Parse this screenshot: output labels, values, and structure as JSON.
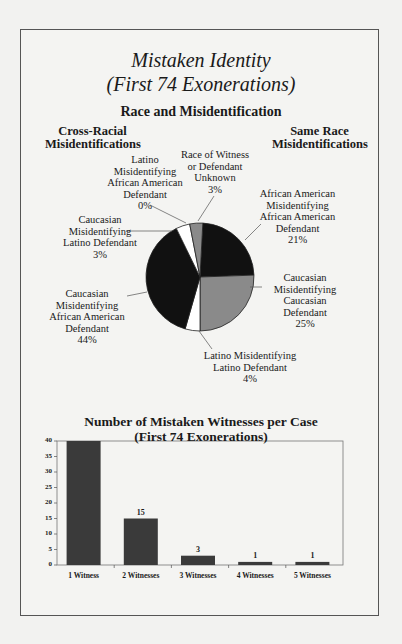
{
  "page": {
    "title": "Mistaken Identity",
    "subtitle": "(First 74 Exonerations)"
  },
  "pie": {
    "title": "Race and Misidentification",
    "group_left": [
      "Cross-Racial",
      "Misidentifications"
    ],
    "group_right": [
      "Same Race",
      "Misidentifications"
    ]
  },
  "bar": {
    "title": "Number of Mistaken Witnesses per Case",
    "subtitle": "(First 74 Exonerations)"
  },
  "chart_data": [
    {
      "type": "pie",
      "title": "Race and Misidentification",
      "annotations": [
        "Cross-Racial Misidentifications",
        "Same Race Misidentifications"
      ],
      "slices": [
        {
          "label": "African American Misidentifying African American Defendant",
          "value": 21,
          "unit": "%",
          "color": "#111111",
          "group": "Same Race"
        },
        {
          "label": "Caucasian Misidentifying Caucasian Defendant",
          "value": 25,
          "unit": "%",
          "color": "#8a8a8a",
          "group": "Same Race"
        },
        {
          "label": "Latino Misidentifying Latino Defendant",
          "value": 4,
          "unit": "%",
          "color": "#ffffff",
          "group": "Same Race"
        },
        {
          "label": "Caucasian Misidentifying African American Defendant",
          "value": 44,
          "unit": "%",
          "color": "#111111",
          "group": "Cross-Racial"
        },
        {
          "label": "Caucasian Misidentifying Latino Defendant",
          "value": 3,
          "unit": "%",
          "color": "#ffffff",
          "group": "Cross-Racial"
        },
        {
          "label": "Latino Misidentifying African American Defendant",
          "value": 0,
          "unit": "%",
          "color": "#ffffff",
          "group": "Cross-Racial"
        },
        {
          "label": "Race of Witness or Defendant Unknown",
          "value": 3,
          "unit": "%",
          "color": "#8a8a8a",
          "group": "Unknown"
        }
      ],
      "labels": {
        "lat_aa": [
          "Latino",
          "Misidentifying",
          "African American",
          "Defendant",
          "0%"
        ],
        "unknown": [
          "Race of Witness",
          "or Defendant",
          "Unknown",
          "3%"
        ],
        "aa_aa": [
          "African American",
          "Misidentifying",
          "African American",
          "Defendant",
          "21%"
        ],
        "cauc_lat": [
          "Caucasian",
          "Misidentifying",
          "Latino Defendant",
          "3%"
        ],
        "cauc_cauc": [
          "Caucasian",
          "Misidentifying",
          "Caucasian",
          "Defendant",
          "25%"
        ],
        "cauc_aa": [
          "Caucasian",
          "Misidentifying",
          "African American",
          "Defendant",
          "44%"
        ],
        "lat_lat": [
          "Latino Misidentifying",
          "Latino Defendant",
          "4%"
        ]
      }
    },
    {
      "type": "bar",
      "title": "Number of Mistaken Witnesses per Case (First 74 Exonerations)",
      "categories": [
        "1 Witness",
        "2 Witnesses",
        "3 Witnesses",
        "4 Witnesses",
        "5 Witnesses"
      ],
      "values": [
        54,
        15,
        3,
        1,
        1
      ],
      "data_labels": [
        "",
        "15",
        "3",
        "1",
        "1"
      ],
      "note": "First bar exceeds axis maximum (clipped at 40); value inferred from total of 74",
      "xlabel": "",
      "ylabel": "",
      "ylim": [
        0,
        40
      ],
      "yticks": [
        0,
        5,
        10,
        15,
        20,
        25,
        30,
        35,
        40
      ],
      "bar_color": "#3a3a3a",
      "grid": false
    }
  ]
}
